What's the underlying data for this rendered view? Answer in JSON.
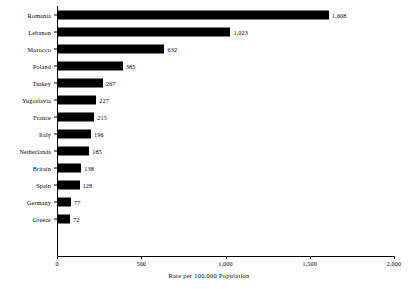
{
  "chart_data": {
    "type": "bar",
    "orientation": "horizontal",
    "title": "",
    "xlabel": "Rate per 100,000 Population",
    "ylabel": "",
    "xlim": [
      0,
      2000
    ],
    "xticks": [
      0,
      500,
      1000,
      1500,
      2000
    ],
    "xtick_labels": [
      "0",
      "500",
      "1,000",
      "1,500",
      "2,000"
    ],
    "grid": false,
    "legend": null,
    "bar_color": "#000000",
    "background_color": "#ffffff",
    "categories": [
      "Romania",
      "Lebanon",
      "Morocco",
      "Poland",
      "Turkey",
      "Yugoslavia",
      "France",
      "Italy",
      "Netherlands",
      "Britain",
      "Spain",
      "Germany",
      "Greece"
    ],
    "values": [
      1608,
      1023,
      632,
      385,
      267,
      227,
      215,
      196,
      185,
      138,
      128,
      77,
      72
    ],
    "value_labels": [
      "1,608",
      "1,023",
      "632",
      "385",
      "267",
      "227",
      "215",
      "196",
      "185",
      "138",
      "128",
      "77",
      "72"
    ]
  }
}
